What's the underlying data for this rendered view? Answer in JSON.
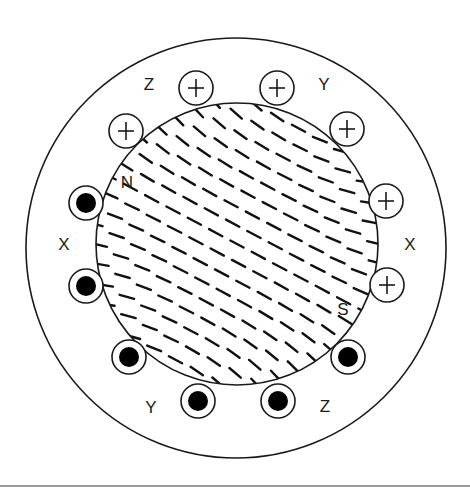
{
  "diagram": {
    "title": "",
    "stator": {
      "cx": 236,
      "cy": 248,
      "r": 210,
      "stroke": "#1a1a1a"
    },
    "rotor": {
      "cx": 237,
      "cy": 244,
      "r": 141,
      "stroke": "#1a1a1a"
    },
    "conductor_radius": 17,
    "conductors_plus": [
      {
        "id": "z-plus-1",
        "phase": "Z",
        "x": 196,
        "y": 88
      },
      {
        "id": "y-plus-1",
        "phase": "Y",
        "x": 277,
        "y": 88
      },
      {
        "id": "z-plus-2",
        "phase": "Z",
        "x": 126,
        "y": 131
      },
      {
        "id": "y-plus-2",
        "phase": "Y",
        "x": 347,
        "y": 129
      },
      {
        "id": "x-plus-1",
        "phase": "X",
        "x": 386,
        "y": 201
      },
      {
        "id": "x-plus-2",
        "phase": "X",
        "x": 387,
        "y": 285
      }
    ],
    "conductors_dot": [
      {
        "id": "x-dot-1",
        "phase": "X",
        "x": 86,
        "y": 203
      },
      {
        "id": "x-dot-2",
        "phase": "X",
        "x": 86,
        "y": 286
      },
      {
        "id": "y-dot-1",
        "phase": "Y",
        "x": 129,
        "y": 357
      },
      {
        "id": "z-dot-1",
        "phase": "Z",
        "x": 348,
        "y": 357
      },
      {
        "id": "y-dot-2",
        "phase": "Y",
        "x": 198,
        "y": 401
      },
      {
        "id": "z-dot-2",
        "phase": "Z",
        "x": 278,
        "y": 401
      }
    ],
    "labels": [
      {
        "id": "label-z-top",
        "text": "Z",
        "x": 149,
        "y": 84
      },
      {
        "id": "label-y-top",
        "text": "Y",
        "x": 324,
        "y": 84
      },
      {
        "id": "label-x-left",
        "text": "X",
        "x": 64,
        "y": 244
      },
      {
        "id": "label-x-right",
        "text": "X",
        "x": 410,
        "y": 244
      },
      {
        "id": "label-y-bottom",
        "text": "Y",
        "x": 151,
        "y": 407
      },
      {
        "id": "label-z-bottom",
        "text": "Z",
        "x": 325,
        "y": 406
      },
      {
        "id": "label-n-pole",
        "text": "N",
        "x": 127,
        "y": 182
      },
      {
        "id": "label-s-pole",
        "text": "S",
        "x": 343,
        "y": 309
      }
    ],
    "field": {
      "description": "Magnetic field lines across rotor from N pole (upper-left) to S pole (lower-right)",
      "spacing": 21,
      "dash_length": 15,
      "base_angle_deg": 28,
      "stroke": "#111111",
      "stroke_width": 2.4
    }
  }
}
